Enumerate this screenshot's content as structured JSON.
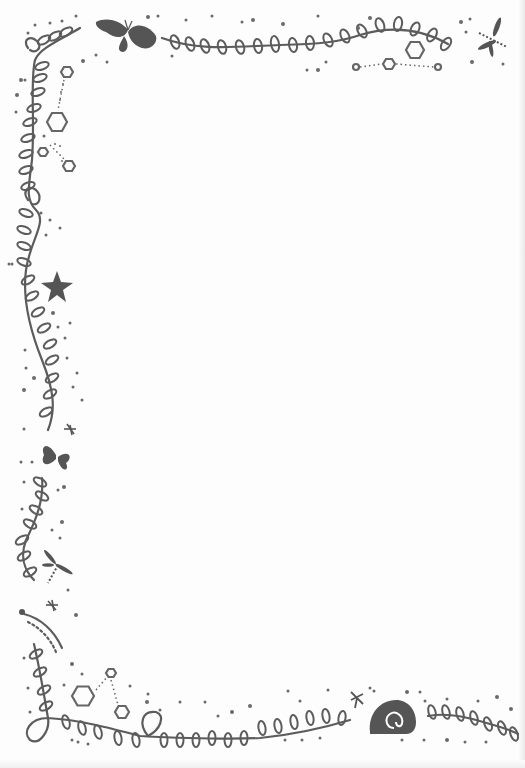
{
  "page": {
    "background": "#fdfdfd",
    "ink_color": "#5c5c5c"
  },
  "frame": {
    "description": "Hand-drawn doodle border on blank stationery page",
    "content_area_text": ""
  },
  "motifs": {
    "top": [
      "vine-with-leaves",
      "moth",
      "hexagons",
      "dragonfly",
      "dots"
    ],
    "left": [
      "vine-with-leaves",
      "hexagons",
      "starfish",
      "dragonfly",
      "butterfly",
      "caterpillar",
      "dots"
    ],
    "bottom": [
      "vine-with-leaves",
      "hexagons",
      "snail-shell",
      "dragonfly",
      "dots"
    ]
  },
  "hexagons": [
    {
      "cx": 67,
      "cy": 72,
      "r": 6
    },
    {
      "cx": 57,
      "cy": 122,
      "r": 10
    },
    {
      "cx": 43,
      "cy": 152,
      "r": 5
    },
    {
      "cx": 69,
      "cy": 166,
      "r": 6
    },
    {
      "cx": 389,
      "cy": 64,
      "r": 6
    },
    {
      "cx": 415,
      "cy": 50,
      "r": 9
    },
    {
      "cx": 356,
      "cy": 67,
      "r": 3
    },
    {
      "cx": 438,
      "cy": 67,
      "r": 3
    },
    {
      "cx": 83,
      "cy": 696,
      "r": 11
    },
    {
      "cx": 122,
      "cy": 712,
      "r": 7
    },
    {
      "cx": 111,
      "cy": 673,
      "r": 5
    }
  ]
}
